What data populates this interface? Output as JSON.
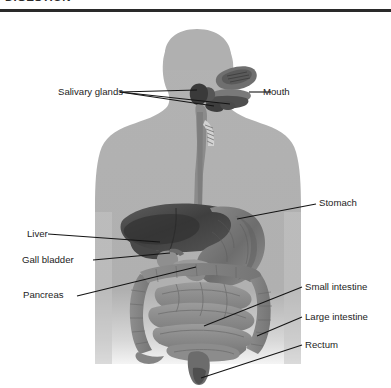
{
  "document": {
    "clipped_heading": "DIGESTION",
    "rule_color": "#2a2a2a"
  },
  "figure": {
    "background_color": "#ffffff",
    "body_silhouette_color": "#adadad",
    "organ_dark_color": "#4a4a4a",
    "organ_mid_color": "#8a8a8a",
    "organ_light_color": "#a2a2a2",
    "leader_line_color": "#1a1a1a"
  },
  "labels": {
    "salivary_glands": "Salivary glands",
    "mouth": "Mouth",
    "stomach": "Stomach",
    "liver": "Liver",
    "gall_bladder": "Gall bladder",
    "pancreas": "Pancreas",
    "small_intestine": "Small intestine",
    "large_intestine": "Large intestine",
    "rectum": "Rectum"
  }
}
